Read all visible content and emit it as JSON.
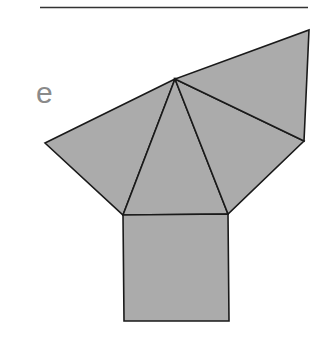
{
  "figure": {
    "label": "e",
    "label_color": "#8a8a8a",
    "fill_color": "#ababab",
    "stroke_color": "#1a1a1a",
    "stroke_width": 1.6,
    "top_rule": {
      "x1": 40,
      "y1": 7.5,
      "x2": 308,
      "y2": 7.5,
      "color": "#333333",
      "width": 1.5
    },
    "vertices": {
      "apex": [
        175,
        79
      ],
      "top_right": [
        309,
        30
      ],
      "right": [
        304,
        141
      ],
      "left": [
        45,
        143
      ],
      "square_top_left": [
        123,
        215
      ],
      "square_top_right": [
        228,
        214
      ],
      "square_bottom_right": [
        229,
        321
      ],
      "square_bottom_left": [
        124,
        321
      ]
    },
    "faces": [
      {
        "name": "left-triangle",
        "points": [
          "apex",
          "left",
          "square_top_left"
        ]
      },
      {
        "name": "front-triangle",
        "points": [
          "apex",
          "square_top_left",
          "square_top_right"
        ]
      },
      {
        "name": "right-triangle",
        "points": [
          "apex",
          "square_top_right",
          "right"
        ]
      },
      {
        "name": "back-triangle",
        "points": [
          "apex",
          "right",
          "top_right"
        ]
      },
      {
        "name": "square-base",
        "points": [
          "square_top_left",
          "square_top_right",
          "square_bottom_right",
          "square_bottom_left"
        ]
      }
    ]
  }
}
